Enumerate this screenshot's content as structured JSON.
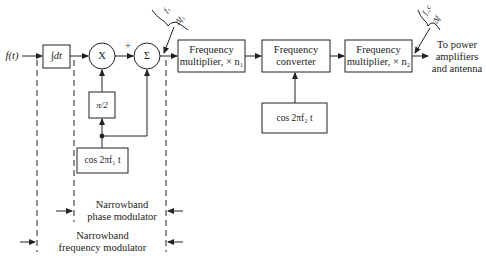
{
  "diagram": {
    "input_label": "f(t)",
    "blocks": {
      "integrator": "∫dt",
      "multiplier_node": "X",
      "summer_node": "Σ",
      "plus_sign": "+",
      "phase_shift": "π/2",
      "oscillator1": "cos 2πf₁ t",
      "freq_mult1_line1": "Frequency",
      "freq_mult1_line2": "multiplier, × n₁",
      "freq_conv_line1": "Frequency",
      "freq_conv_line2": "converter",
      "oscillator2": "cos 2πf₂ t",
      "freq_mult2_line1": "Frequency",
      "freq_mult2_line2": "multiplier, × n₂"
    },
    "annotations": {
      "brace1_top": "f₁",
      "brace1_bottom": "Δf₁",
      "brace2_top": "f_c",
      "brace2_bottom": "Δf",
      "output_line1": "To power",
      "output_line2": "amplifiers",
      "output_line3": "and antenna"
    },
    "regions": {
      "phase_mod_line1": "Narrowband",
      "phase_mod_line2": "phase modulator",
      "freq_mod_line1": "Narrowband",
      "freq_mod_line2": "frequency modulator"
    }
  }
}
